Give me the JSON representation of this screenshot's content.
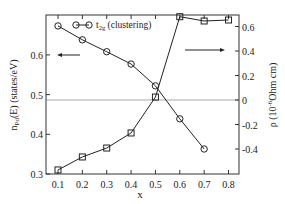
{
  "chart_data": {
    "type": "line",
    "title": "",
    "xlabel": "x",
    "ylabel_left": "n_Pd(E) (states/eV)",
    "ylabel_right": "ρ (10^-6 Ohm cm)",
    "xlim": [
      0.05,
      0.85
    ],
    "ylim_left": [
      0.3,
      0.7
    ],
    "ylim_right": [
      -0.6,
      0.7
    ],
    "x_ticks": [
      "0.1",
      "0.2",
      "0.3",
      "0.4",
      "0.5",
      "0.6",
      "0.7",
      "0.8"
    ],
    "y_ticks_left": [
      "0.3",
      "0.4",
      "0.5",
      "0.6"
    ],
    "y_ticks_right": [
      "-0.4",
      "-0.2",
      "0",
      "0.2",
      "0.4",
      "0.6"
    ],
    "grid": false,
    "reference_line": {
      "axis": "right",
      "y": 0,
      "color": "#aaaaaa"
    },
    "legend": [
      {
        "label": "t2g (clustering)",
        "marker": "circle"
      }
    ],
    "series": [
      {
        "name": "n_Pd(E)",
        "axis": "left",
        "marker": "circle",
        "x": [
          0.1,
          0.2,
          0.3,
          0.4,
          0.5,
          0.6,
          0.7
        ],
        "values": [
          0.673,
          0.638,
          0.608,
          0.577,
          0.522,
          0.439,
          0.363
        ]
      },
      {
        "name": "ρ",
        "axis": "right",
        "marker": "square",
        "x": [
          0.1,
          0.2,
          0.3,
          0.4,
          0.5,
          0.6,
          0.7,
          0.8
        ],
        "values": [
          -0.571,
          -0.465,
          -0.392,
          -0.269,
          0.024,
          0.68,
          0.645,
          0.653
        ]
      }
    ],
    "annotations": [
      {
        "type": "arrow",
        "direction": "left",
        "meaning": "circles refer to left axis"
      },
      {
        "type": "arrow",
        "direction": "right",
        "meaning": "squares refer to right axis"
      }
    ]
  },
  "labels": {
    "xlabel": "x",
    "legend_t": "t",
    "legend_sub": "2g",
    "legend_rest": " (clustering)",
    "ylabel_left_main": "n",
    "ylabel_left_sub": "Pd",
    "ylabel_left_rest": "(E) (states/eV)",
    "ylabel_right_main": "ρ (10",
    "ylabel_right_sup": "-6",
    "ylabel_right_rest": "Ohm cm)"
  }
}
